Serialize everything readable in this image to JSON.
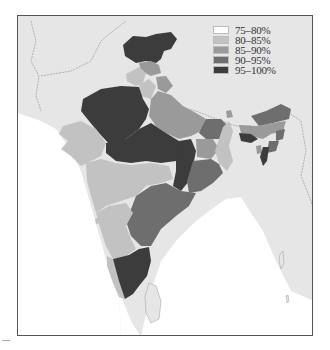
{
  "map": {
    "title": "",
    "legend": [
      {
        "label": "75–80%",
        "color": "#ffffff"
      },
      {
        "label": "80–85%",
        "color": "#c2c2c2"
      },
      {
        "label": "85–90%",
        "color": "#9a9a9a"
      },
      {
        "label": "90–95%",
        "color": "#6e6e6e"
      },
      {
        "label": "95–100%",
        "color": "#3c3c3c"
      }
    ],
    "colors": {
      "background": "#e6e6e6",
      "sea": "#ffffff",
      "frame": "#555555",
      "border_dashed": "#8a8a8a"
    },
    "regions": [
      {
        "name": "Jammu and Kashmir",
        "category": "95–100%"
      },
      {
        "name": "Himachal Pradesh",
        "category": "85–90%"
      },
      {
        "name": "Punjab",
        "category": "80–85%"
      },
      {
        "name": "Uttarakhand",
        "category": "85–90%"
      },
      {
        "name": "Haryana",
        "category": "80–85%"
      },
      {
        "name": "Rajasthan",
        "category": "95–100%"
      },
      {
        "name": "Uttar Pradesh",
        "category": "85–90%"
      },
      {
        "name": "Bihar",
        "category": "90–95%"
      },
      {
        "name": "Gujarat",
        "category": "80–85%"
      },
      {
        "name": "Madhya Pradesh",
        "category": "95–100%"
      },
      {
        "name": "Chhattisgarh",
        "category": "95–100%"
      },
      {
        "name": "Jharkhand",
        "category": "85–90%"
      },
      {
        "name": "West Bengal",
        "category": "80–85%"
      },
      {
        "name": "Odisha",
        "category": "90–95%"
      },
      {
        "name": "Maharashtra",
        "category": "80–85%"
      },
      {
        "name": "Andhra Pradesh",
        "category": "90–95%"
      },
      {
        "name": "Karnataka",
        "category": "80–85%"
      },
      {
        "name": "Goa",
        "category": "80–85%"
      },
      {
        "name": "Kerala",
        "category": "80–85%"
      },
      {
        "name": "Tamil Nadu",
        "category": "95–100%"
      },
      {
        "name": "Sikkim",
        "category": "85–90%"
      },
      {
        "name": "Arunachal Pradesh",
        "category": "90–95%"
      },
      {
        "name": "Assam",
        "category": "85–90%"
      },
      {
        "name": "Meghalaya",
        "category": "95–100%"
      },
      {
        "name": "Nagaland",
        "category": "90–95%"
      },
      {
        "name": "Manipur",
        "category": "90–95%"
      },
      {
        "name": "Tripura",
        "category": "85–90%"
      },
      {
        "name": "Mizoram",
        "category": "95–100%"
      }
    ]
  }
}
